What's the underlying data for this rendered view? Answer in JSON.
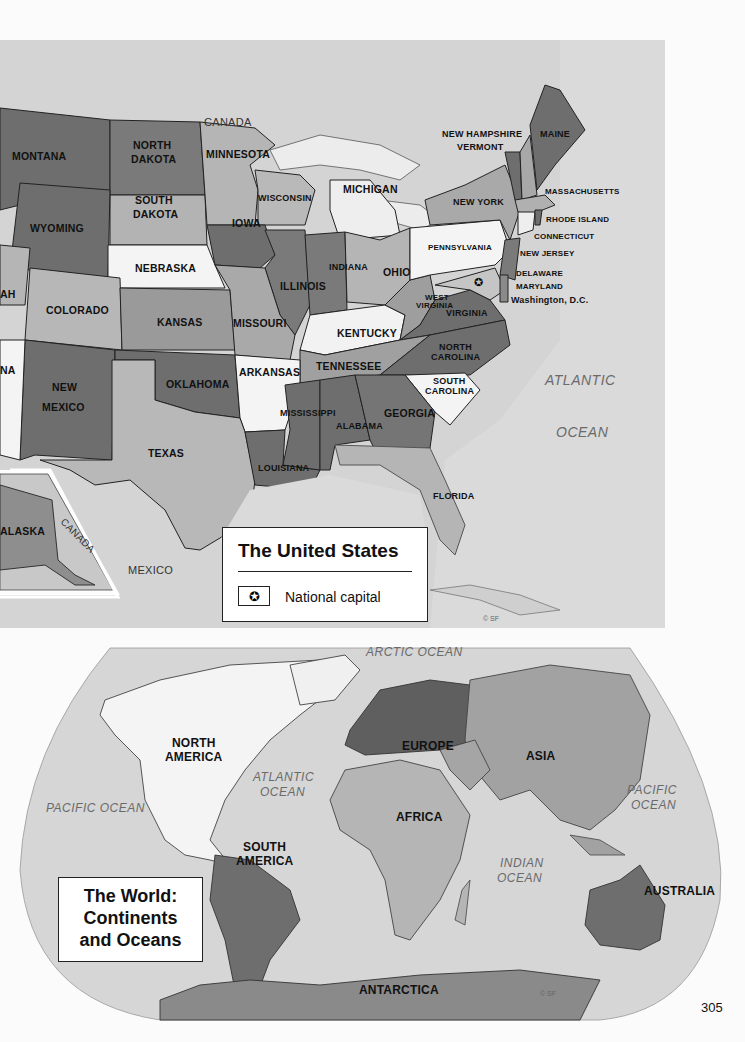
{
  "page_number": "305",
  "us_map": {
    "title": "The United States",
    "legend": {
      "symbol": "star-in-circle",
      "symbol_glyph": "✪",
      "label": "National capital"
    },
    "copyright": "© SF",
    "countries": [
      "CANADA",
      "MEXICO"
    ],
    "inset_labels": {
      "state": "ALASKA",
      "country": "CANADA"
    },
    "oceans": [
      {
        "line1": "ATLANTIC",
        "line2": "OCEAN"
      }
    ],
    "states": {
      "montana": "MONTANA",
      "north_dakota_1": "NORTH",
      "north_dakota_2": "DAKOTA",
      "south_dakota_1": "SOUTH",
      "south_dakota_2": "DAKOTA",
      "minnesota": "MINNESOTA",
      "wyoming": "WYOMING",
      "nebraska": "NEBRASKA",
      "iowa": "IOWA",
      "wisconsin": "WISCONSIN",
      "michigan": "MICHIGAN",
      "utah_partial": "AH",
      "colorado": "COLORADO",
      "kansas": "KANSAS",
      "missouri": "MISSOURI",
      "illinois": "ILLINOIS",
      "indiana": "INDIANA",
      "ohio": "OHIO",
      "kentucky": "KENTUCKY",
      "arizona_partial": "NA",
      "new_mexico_1": "NEW",
      "new_mexico_2": "MEXICO",
      "oklahoma": "OKLAHOMA",
      "arkansas": "ARKANSAS",
      "tennessee": "TENNESSEE",
      "texas": "TEXAS",
      "louisiana": "LOUISIANA",
      "mississippi": "MISSISSIPPI",
      "alabama": "ALABAMA",
      "georgia": "GEORGIA",
      "florida": "FLORIDA",
      "south_carolina_1": "SOUTH",
      "south_carolina_2": "CAROLINA",
      "north_carolina_1": "NORTH",
      "north_carolina_2": "CAROLINA",
      "virginia": "VIRGINIA",
      "west_virginia_1": "WEST",
      "west_virginia_2": "VIRGINIA",
      "pennsylvania": "PENNSYLVANIA",
      "new_york": "NEW YORK",
      "new_hampshire": "NEW HAMPSHIRE",
      "vermont": "VERMONT",
      "maine": "MAINE",
      "massachusetts": "MASSACHUSETTS",
      "rhode_island": "RHODE ISLAND",
      "connecticut": "CONNECTICUT",
      "new_jersey": "NEW JERSEY",
      "delaware": "DELAWARE",
      "maryland": "MARYLAND",
      "washington_dc": "Washington, D.C."
    }
  },
  "world_map": {
    "title_line1": "The World:",
    "title_line2": "Continents",
    "title_line3": "and Oceans",
    "copyright": "© SF",
    "continents": {
      "north_america_1": "NORTH",
      "north_america_2": "AMERICA",
      "south_america_1": "SOUTH",
      "south_america_2": "AMERICA",
      "europe": "EUROPE",
      "asia": "ASIA",
      "africa": "AFRICA",
      "australia": "AUSTRALIA",
      "antarctica": "ANTARCTICA"
    },
    "oceans": {
      "arctic": "ARCTIC OCEAN",
      "atlantic_1": "ATLANTIC",
      "atlantic_2": "OCEAN",
      "pacific_west": "PACIFIC OCEAN",
      "pacific_east_1": "PACIFIC",
      "pacific_east_2": "OCEAN",
      "indian_1": "INDIAN",
      "indian_2": "OCEAN"
    }
  },
  "colors": {
    "ocean_us": "#d3d3d3",
    "dark_state": "#6e6e6e",
    "mid_state": "#9a9a9a",
    "light_state": "#b9b9b9",
    "white_state": "#f4f4f4",
    "world_ocean": "#d6d6d6"
  }
}
